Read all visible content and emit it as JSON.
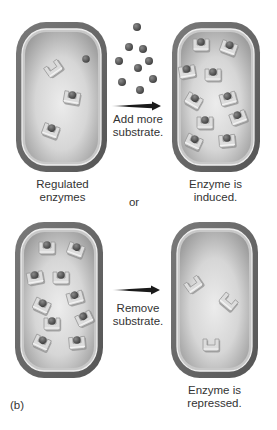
{
  "figure": {
    "panel_label": "(b)",
    "separator": "or",
    "colors": {
      "cell_wall": "#6e6e6e",
      "cell_wall_dark": "#555555",
      "membrane": "#e6e6e6",
      "cytoplasm_center": "#e9e9e9",
      "cytoplasm_edge": "#9a9a9a",
      "enzyme": "#d8d8d8",
      "enzyme_shadow": "#8a8a8a",
      "substrate": "#5a5a5a",
      "arrow": "#1a1a1a"
    },
    "top_row": {
      "left_cell": {
        "caption": [
          "Regulated",
          "enzymes"
        ],
        "box": {
          "x": 16,
          "y": 22,
          "w": 91,
          "h": 150
        },
        "enzymes": [
          {
            "x": 53,
            "y": 68,
            "rot": -35,
            "bound": false
          },
          {
            "x": 72,
            "y": 97,
            "rot": 10,
            "bound": true
          },
          {
            "x": 51,
            "y": 130,
            "rot": 20,
            "bound": true
          }
        ],
        "free_substrate": [
          {
            "x": 86,
            "y": 59
          }
        ]
      },
      "arrow_text": [
        "Add more",
        "substrate."
      ],
      "substrate_pool": [
        {
          "x": 137,
          "y": 27
        },
        {
          "x": 129,
          "y": 47
        },
        {
          "x": 143,
          "y": 49
        },
        {
          "x": 119,
          "y": 61
        },
        {
          "x": 149,
          "y": 61
        },
        {
          "x": 138,
          "y": 68
        },
        {
          "x": 122,
          "y": 82
        },
        {
          "x": 153,
          "y": 79
        },
        {
          "x": 140,
          "y": 90
        }
      ],
      "right_cell": {
        "caption": [
          "Enzyme is",
          "induced."
        ],
        "box": {
          "x": 172,
          "y": 22,
          "w": 88,
          "h": 150
        },
        "enzymes": [
          {
            "x": 201,
            "y": 44,
            "rot": 0,
            "bound": true
          },
          {
            "x": 229,
            "y": 47,
            "rot": 20,
            "bound": true
          },
          {
            "x": 187,
            "y": 71,
            "rot": -10,
            "bound": true
          },
          {
            "x": 213,
            "y": 74,
            "rot": 0,
            "bound": true
          },
          {
            "x": 194,
            "y": 100,
            "rot": 30,
            "bound": true
          },
          {
            "x": 228,
            "y": 98,
            "rot": -15,
            "bound": true
          },
          {
            "x": 205,
            "y": 122,
            "rot": 0,
            "bound": true
          },
          {
            "x": 238,
            "y": 117,
            "rot": -20,
            "bound": true
          },
          {
            "x": 194,
            "y": 141,
            "rot": 25,
            "bound": true
          },
          {
            "x": 227,
            "y": 140,
            "rot": -5,
            "bound": true
          }
        ]
      }
    },
    "bottom_row": {
      "left_cell": {
        "box": {
          "x": 15,
          "y": 222,
          "w": 88,
          "h": 156
        },
        "enzymes": [
          {
            "x": 47,
            "y": 247,
            "rot": 0,
            "bound": true
          },
          {
            "x": 76,
            "y": 249,
            "rot": 20,
            "bound": true
          },
          {
            "x": 35,
            "y": 277,
            "rot": -10,
            "bound": true
          },
          {
            "x": 61,
            "y": 277,
            "rot": 0,
            "bound": true
          },
          {
            "x": 42,
            "y": 305,
            "rot": 25,
            "bound": true
          },
          {
            "x": 75,
            "y": 297,
            "rot": -15,
            "bound": true
          },
          {
            "x": 52,
            "y": 323,
            "rot": 0,
            "bound": true
          },
          {
            "x": 84,
            "y": 318,
            "rot": -25,
            "bound": true
          },
          {
            "x": 42,
            "y": 342,
            "rot": 25,
            "bound": true
          },
          {
            "x": 77,
            "y": 342,
            "rot": -5,
            "bound": true
          }
        ]
      },
      "arrow_text": [
        "Remove",
        "substrate."
      ],
      "right_cell": {
        "caption": [
          "Enzyme is",
          "repressed."
        ],
        "box": {
          "x": 171,
          "y": 222,
          "w": 87,
          "h": 156
        },
        "enzymes": [
          {
            "x": 193,
            "y": 284,
            "rot": -35,
            "bound": false
          },
          {
            "x": 229,
            "y": 301,
            "rot": 40,
            "bound": false
          },
          {
            "x": 211,
            "y": 344,
            "rot": 0,
            "bound": false
          }
        ]
      }
    }
  }
}
